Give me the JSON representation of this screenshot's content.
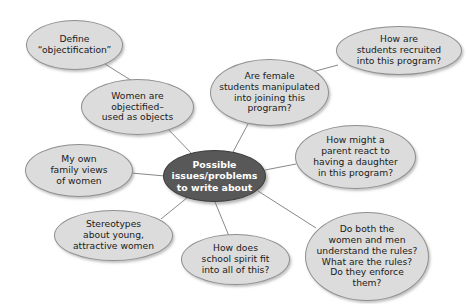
{
  "diagram": {
    "type": "mind-map",
    "title": "Possible issues/problems to write about",
    "center": {
      "id": "center",
      "label": "Possible\nissues/problems\nto write about",
      "fill": "#585858",
      "text_color": "#ffffff",
      "x": 163,
      "y": 150,
      "w": 103,
      "h": 52
    },
    "nodes": [
      {
        "id": "define-objectification",
        "label": "Define\n“objectification”",
        "x": 26,
        "y": 20,
        "w": 97,
        "h": 50,
        "fill": "#dcdcdc"
      },
      {
        "id": "women-objectified",
        "label": "Women are\nobjectified–\nused as objects",
        "x": 81,
        "y": 79,
        "w": 113,
        "h": 56,
        "fill": "#dcdcdc"
      },
      {
        "id": "my-own-family-views",
        "label": "My own\nfamily views\nof women",
        "x": 25,
        "y": 144,
        "w": 108,
        "h": 53,
        "fill": "#dcdcdc"
      },
      {
        "id": "stereotypes-young-women",
        "label": "Stereotypes\nabout young,\nattractive women",
        "x": 54,
        "y": 210,
        "w": 119,
        "h": 51,
        "fill": "#dcdcdc"
      },
      {
        "id": "school-spirit",
        "label": "How does\nschool spirit fit\ninto all of this?",
        "x": 181,
        "y": 234,
        "w": 109,
        "h": 51,
        "fill": "#dcdcdc"
      },
      {
        "id": "understand-rules",
        "label": "Do both the\nwomen and men\nunderstand the rules?\nWhat are the rules?\nDo they enforce\nthem?",
        "x": 305,
        "y": 212,
        "w": 124,
        "h": 89,
        "fill": "#dcdcdc"
      },
      {
        "id": "parent-react",
        "label": "How might a\nparent react to\nhaving a daughter\nin this program?",
        "x": 295,
        "y": 125,
        "w": 121,
        "h": 64,
        "fill": "#dcdcdc"
      },
      {
        "id": "female-students-manipulated",
        "label": "Are female\nstudents manipulated\ninto joining this\nprogram?",
        "x": 210,
        "y": 59,
        "w": 119,
        "h": 67,
        "fill": "#dcdcdc"
      },
      {
        "id": "students-recruited",
        "label": "How are\nstudents recruited\ninto this program?",
        "x": 336,
        "y": 26,
        "w": 126,
        "h": 49,
        "fill": "#dcdcdc"
      }
    ],
    "edges": [
      {
        "id": "edge-define-to-women",
        "from": "define-objectification",
        "to": "women-objectified",
        "x1": 105,
        "y1": 64,
        "x2": 137,
        "y2": 84
      },
      {
        "id": "edge-women-to-center",
        "from": "women-objectified",
        "to": "center",
        "x1": 166,
        "y1": 127,
        "x2": 193,
        "y2": 155
      },
      {
        "id": "edge-family-to-center",
        "from": "my-own-family-views",
        "to": "center",
        "x1": 131,
        "y1": 173,
        "x2": 165,
        "y2": 176
      },
      {
        "id": "edge-stereotypes-to-center",
        "from": "stereotypes-young-women",
        "to": "center",
        "x1": 161,
        "y1": 219,
        "x2": 188,
        "y2": 197
      },
      {
        "id": "edge-spirit-to-center",
        "from": "school-spirit",
        "to": "center",
        "x1": 229,
        "y1": 236,
        "x2": 215,
        "y2": 202
      },
      {
        "id": "edge-rules-to-center",
        "from": "understand-rules",
        "to": "center",
        "x1": 316,
        "y1": 228,
        "x2": 258,
        "y2": 191
      },
      {
        "id": "edge-parent-to-center",
        "from": "parent-react",
        "to": "center",
        "x1": 296,
        "y1": 164,
        "x2": 265,
        "y2": 170
      },
      {
        "id": "edge-female-to-center",
        "from": "female-students-manipulated",
        "to": "center",
        "x1": 248,
        "y1": 124,
        "x2": 233,
        "y2": 152
      },
      {
        "id": "edge-recruited-to-female",
        "from": "students-recruited",
        "to": "female-students-manipulated",
        "x1": 338,
        "y1": 65,
        "x2": 312,
        "y2": 72
      }
    ],
    "edge_color": "#888888"
  }
}
